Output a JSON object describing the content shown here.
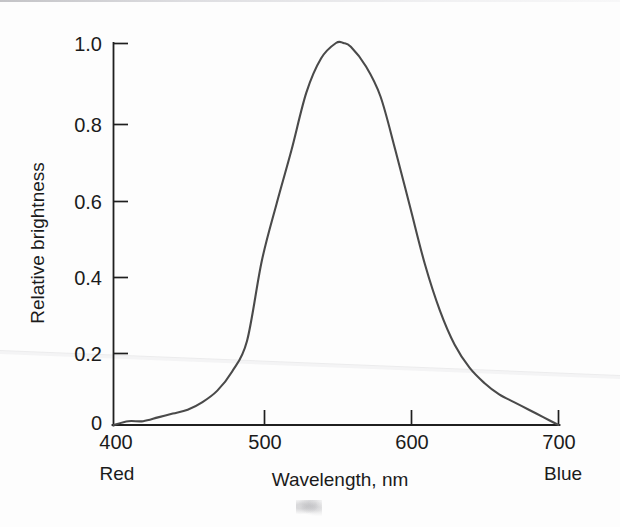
{
  "chart_data": {
    "type": "line",
    "title": "",
    "xlabel": "Wavelength, nm",
    "ylabel": "Relative brightness",
    "xlim": [
      400,
      700
    ],
    "ylim": [
      0,
      1.0
    ],
    "grid": false,
    "legend": "none",
    "x_ticks": [
      {
        "value": 400,
        "label": "400"
      },
      {
        "value": 500,
        "label": "500"
      },
      {
        "value": 600,
        "label": "600"
      },
      {
        "value": 700,
        "label": "700"
      }
    ],
    "y_ticks": [
      {
        "value": 0.0,
        "label": "0"
      },
      {
        "value": 0.2,
        "label": "0.2"
      },
      {
        "value": 0.4,
        "label": "0.4"
      },
      {
        "value": 0.6,
        "label": "0.6"
      },
      {
        "value": 0.8,
        "label": "0.8"
      },
      {
        "value": 1.0,
        "label": "1.0"
      }
    ],
    "annotations": [
      {
        "text": "Red",
        "position": "below-x-axis-left",
        "x": 400
      },
      {
        "text": "Blue",
        "position": "below-x-axis-right",
        "x": 700
      }
    ],
    "series": [
      {
        "name": "Relative brightness",
        "color": "#4a4a4a",
        "x": [
          400,
          410,
          420,
          430,
          440,
          450,
          460,
          470,
          480,
          490,
          500,
          510,
          520,
          530,
          540,
          550,
          555,
          560,
          570,
          580,
          590,
          600,
          610,
          620,
          630,
          640,
          650,
          660,
          670,
          680,
          690,
          700
        ],
        "y": [
          0.0,
          0.01,
          0.01,
          0.02,
          0.03,
          0.04,
          0.06,
          0.09,
          0.14,
          0.22,
          0.43,
          0.58,
          0.72,
          0.87,
          0.96,
          1.0,
          1.0,
          0.99,
          0.94,
          0.86,
          0.72,
          0.57,
          0.42,
          0.3,
          0.21,
          0.15,
          0.11,
          0.08,
          0.06,
          0.04,
          0.02,
          0.0
        ]
      }
    ]
  },
  "axis": {
    "y_title": "Relative brightness",
    "x_title": "Wavelength, nm",
    "y_tick_labels": [
      "1.0",
      "0.8",
      "0.6",
      "0.4",
      "0.2",
      "0"
    ],
    "x_tick_labels": [
      "400",
      "500",
      "600",
      "700"
    ],
    "left_end_label": "Red",
    "right_end_label": "Blue"
  },
  "style": {
    "curve_color": "#4a4a4a",
    "axis_color": "#1f1f1f",
    "text_color": "#1b1b1b",
    "background": "#fdfdfd"
  }
}
